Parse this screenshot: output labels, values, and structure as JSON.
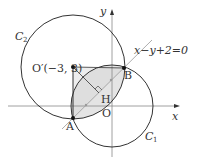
{
  "diagram": {
    "axes": {
      "x_label": "x",
      "y_label": "y",
      "origin_label": "O"
    },
    "circles": [
      {
        "name": "C1",
        "label": "C",
        "subscript": "1",
        "center": [
          0,
          0
        ],
        "radius_sq": 10
      },
      {
        "name": "C2",
        "label": "C",
        "subscript": "2",
        "center": [
          -3,
          3
        ],
        "radius": 4
      }
    ],
    "line": {
      "equation": "x−y+2=0"
    },
    "points": {
      "center_c2": {
        "label": "O′(−3, 3)",
        "coords": [
          -3,
          3
        ]
      },
      "A": {
        "label": "A",
        "coords": [
          -3,
          -1
        ]
      },
      "B": {
        "label": "B",
        "coords": [
          1,
          3
        ]
      },
      "H": {
        "label": "H",
        "coords": [
          -1,
          1
        ]
      }
    },
    "colors": {
      "stroke": "#333333",
      "axis": "#888888",
      "shade": "#e4e4e4",
      "chord_line": "#999999"
    }
  }
}
